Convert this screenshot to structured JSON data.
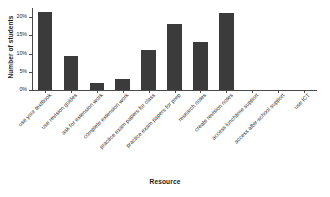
{
  "chart_data": {
    "type": "bar",
    "title": "",
    "xlabel": "Resource",
    "ylabel": "Number of students",
    "ylim": [
      0,
      22.5
    ],
    "ytick_values": [
      0,
      5,
      10,
      15,
      20
    ],
    "ytick_labels": [
      "0%",
      "5%",
      "10%",
      "15%",
      "20%"
    ],
    "grid": false,
    "legend": null,
    "bar_color": "#3b3b3b",
    "categories": [
      "use your textbook",
      "use revision guides",
      "ask for extension work",
      "complete extension work",
      "practice exam papers for class",
      "practice exam papers for prep",
      "research notes",
      "create revision notes",
      "access lunchtime support",
      "access after-school support",
      "use ICT"
    ],
    "values": [
      21.5,
      9.2,
      1.8,
      3.0,
      11.1,
      18.2,
      13.2,
      21.2,
      0,
      0,
      0
    ]
  },
  "axes": {
    "ylabel_text": "Number of students",
    "xlabel_text": "Resource"
  }
}
